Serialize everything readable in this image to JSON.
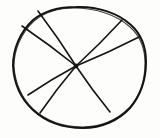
{
  "figure": {
    "title": "Hand-drawn circle divided into sectors",
    "kind": "sketch-diagram",
    "background_color": "#fdfdfb",
    "ink_color": "#141414",
    "canvas": {
      "width": 160,
      "height": 138
    }
  },
  "chart_data": {
    "type": "pie",
    "title": "",
    "subtitle": "",
    "xlabel": "",
    "ylabel": "",
    "legend_position": "none",
    "grid": false,
    "style": "hand-drawn ink sketch, no labels, no fills",
    "center": {
      "x": 76,
      "y": 66
    },
    "outline": {
      "shape": "irregular hand-drawn circle",
      "bbox": {
        "left": 13,
        "top": 7,
        "right": 146,
        "bottom": 128
      },
      "radius_x": 66,
      "radius_y": 60
    },
    "categories": [
      "S1",
      "S2",
      "S3",
      "S4",
      "S5",
      "S6",
      "S7"
    ],
    "values": [
      42,
      44,
      52,
      68,
      55,
      51,
      48
    ],
    "radii": [
      {
        "name": "radius-top-left",
        "endpoint": {
          "x": 38,
          "y": 11
        },
        "angle_deg": 122
      },
      {
        "name": "radius-upper-right",
        "endpoint": {
          "x": 122,
          "y": 20
        },
        "angle_deg": 43
      },
      {
        "name": "radius-right-upper",
        "endpoint": {
          "x": 139,
          "y": 37
        },
        "angle_deg": 25
      },
      {
        "name": "radius-lower-right",
        "endpoint": {
          "x": 110,
          "y": 112
        },
        "angle_deg": -56
      },
      {
        "name": "radius-lower-left",
        "endpoint": {
          "x": 40,
          "y": 113
        },
        "angle_deg": -129
      },
      {
        "name": "radius-left-lower",
        "endpoint": {
          "x": 28,
          "y": 95
        },
        "angle_deg": -149
      },
      {
        "name": "radius-left-upper",
        "endpoint": {
          "x": 22,
          "y": 26
        },
        "angle_deg": 143
      }
    ],
    "sector_count": 7,
    "annotations": []
  }
}
